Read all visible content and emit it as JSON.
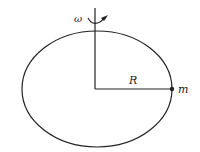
{
  "diagram": {
    "type": "rotating-loop",
    "labels": {
      "angular_velocity": "ω",
      "radius": "R",
      "mass": "m"
    },
    "colors": {
      "stroke": "#222222",
      "background": "#ffffff"
    }
  }
}
